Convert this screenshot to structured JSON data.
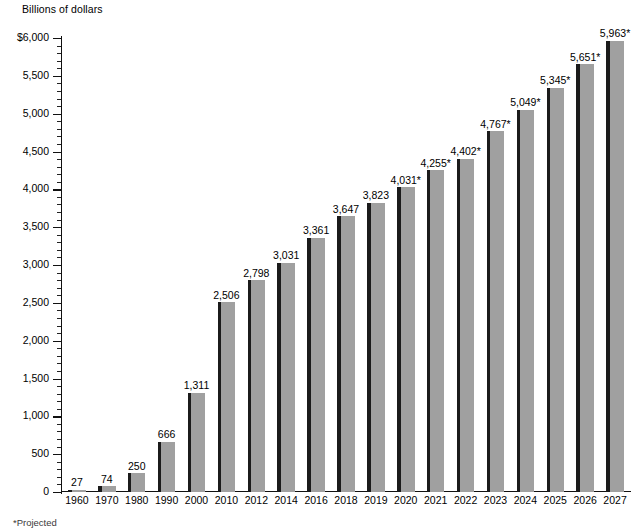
{
  "axis_unit_label": "Billions of dollars",
  "footnote": "*Projected",
  "colors": {
    "bar_fill": "#a0a0a0",
    "bar_edge": "#1b1b1b",
    "axis": "#111111",
    "background": "#ffffff",
    "text": "#000000"
  },
  "chart_data": {
    "type": "bar",
    "title": "",
    "subtitle": "",
    "xlabel": "",
    "ylabel": "Billions of dollars",
    "ylim": [
      0,
      6000
    ],
    "ytick_step": 500,
    "yminor_step": 100,
    "grid": false,
    "legend": null,
    "categories": [
      "1960",
      "1970",
      "1980",
      "1990",
      "2000",
      "2010",
      "2012",
      "2014",
      "2016",
      "2018",
      "2019",
      "2020",
      "2021",
      "2022",
      "2023",
      "2024",
      "2025",
      "2026",
      "2027"
    ],
    "values": [
      27,
      74,
      250,
      666,
      1311,
      2506,
      2798,
      3031,
      3361,
      3647,
      3823,
      4031,
      4255,
      4402,
      4767,
      5049,
      5345,
      5651,
      5963
    ],
    "data_labels": [
      "27",
      "74",
      "250",
      "666",
      "1,311",
      "2,506",
      "2,798",
      "3,031",
      "3,361",
      "3,647",
      "3,823",
      "4,031*",
      "4,255*",
      "4,402*",
      "4,767*",
      "5,049*",
      "5,345*",
      "5,651*",
      "5,963*"
    ],
    "projected_flags": [
      false,
      false,
      false,
      false,
      false,
      false,
      false,
      false,
      false,
      false,
      false,
      true,
      true,
      true,
      true,
      true,
      true,
      true,
      true
    ],
    "ytick_labels": [
      "0",
      "500",
      "1,000",
      "1,500",
      "2,000",
      "2,500",
      "3,000",
      "3,500",
      "4,000",
      "4,500",
      "5,000",
      "5,500",
      "$6,000"
    ],
    "ytick_values": [
      0,
      500,
      1000,
      1500,
      2000,
      2500,
      3000,
      3500,
      4000,
      4500,
      5000,
      5500,
      6000
    ],
    "annotation": "*Projected"
  }
}
